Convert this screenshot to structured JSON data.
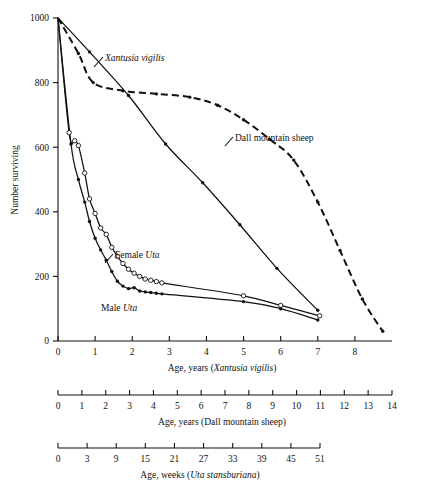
{
  "figure": {
    "ylabel": "Number surviving",
    "primary_axis_label_prefix": "Age, years (",
    "primary_axis_label_italic": "Xantusia vigilis",
    "primary_axis_label_suffix": ")",
    "second_axis_label": "Age, years (Dall mountain sheep)",
    "third_axis_label_prefix": "Age, weeks (",
    "third_axis_label_italic": "Uta stansburiana",
    "third_axis_label_suffix": ")"
  },
  "annotations": {
    "xantusia": "Xantusia vigilis",
    "dall": "Dall mountain sheep",
    "female_uta_prefix": "Female ",
    "female_uta_italic": "Uta",
    "male_uta_prefix": "Male ",
    "male_uta_italic": "Uta"
  },
  "chart_data": {
    "type": "line",
    "title": "",
    "xlabel": "Age, years (Xantusia vigilis)",
    "ylabel": "Number surviving",
    "xlim": [
      0,
      9
    ],
    "ylim": [
      0,
      1000
    ],
    "grid": false,
    "legend": "inline-annotations",
    "y_ticks": [
      0,
      200,
      400,
      600,
      800,
      1000
    ],
    "x_ticks_primary": [
      0,
      1,
      2,
      3,
      4,
      5,
      6,
      7,
      8
    ],
    "x_ticks_dall": [
      0,
      1,
      2,
      3,
      4,
      5,
      6,
      7,
      8,
      9,
      10,
      11,
      12,
      13,
      14
    ],
    "x_ticks_uta_weeks": [
      0,
      3,
      9,
      15,
      21,
      27,
      33,
      39,
      45,
      51
    ],
    "series": [
      {
        "name": "Xantusia vigilis",
        "style": "solid",
        "marker": "filled-circle",
        "x": [
          0,
          0.85,
          1.9,
          2.9,
          3.9,
          4.9,
          5.9,
          7.0
        ],
        "y": [
          1000,
          895,
          760,
          610,
          490,
          360,
          225,
          95
        ]
      },
      {
        "name": "Dall mountain sheep",
        "style": "dashed",
        "marker": "filled-circle",
        "x": [
          0,
          0.55,
          0.95,
          1.75,
          2.65,
          3.55,
          4.3,
          5.0,
          5.7,
          6.35,
          7.0,
          7.6,
          8.2,
          8.75
        ],
        "y": [
          1000,
          890,
          800,
          775,
          765,
          755,
          730,
          685,
          625,
          560,
          430,
          280,
          130,
          30
        ]
      },
      {
        "name": "Female Uta",
        "style": "solid",
        "marker": "open-circle",
        "x": [
          0,
          0.3,
          0.45,
          0.55,
          0.72,
          0.85,
          1.0,
          1.15,
          1.3,
          1.45,
          1.6,
          1.75,
          1.9,
          2.05,
          2.2,
          2.35,
          2.5,
          2.65,
          2.8,
          5.0,
          6.0,
          7.05
        ],
        "y": [
          1000,
          645,
          620,
          605,
          520,
          440,
          395,
          350,
          330,
          290,
          262,
          240,
          222,
          210,
          200,
          192,
          188,
          184,
          180,
          140,
          110,
          78
        ]
      },
      {
        "name": "Male Uta",
        "style": "solid",
        "marker": "filled-circle",
        "x": [
          0,
          0.35,
          0.55,
          0.72,
          0.85,
          1.0,
          1.15,
          1.3,
          1.45,
          1.6,
          1.75,
          1.9,
          2.05,
          2.2,
          2.35,
          2.5,
          2.65,
          2.8,
          5.0,
          6.0,
          7.0
        ],
        "y": [
          1000,
          610,
          500,
          430,
          370,
          318,
          282,
          250,
          215,
          185,
          170,
          162,
          165,
          155,
          152,
          150,
          148,
          146,
          122,
          100,
          65
        ]
      }
    ],
    "annotations": [
      {
        "text": "Xantusia vigilis",
        "x": 1.25,
        "y": 875,
        "italic": true
      },
      {
        "text": "Dall mountain sheep",
        "x": 5.3,
        "y": 640,
        "italic": false
      },
      {
        "text": "Female Uta",
        "x": 1.6,
        "y": 280,
        "italic": false
      },
      {
        "text": "Male Uta",
        "x": 1.25,
        "y": 120,
        "italic": false
      }
    ]
  }
}
